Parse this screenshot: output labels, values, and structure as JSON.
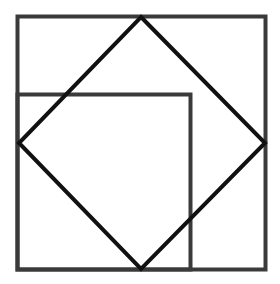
{
  "diagram": {
    "type": "geometric-figure",
    "colors": {
      "outer_square_stroke": "#3a3a3a",
      "inner_square_stroke": "#3a3a3a",
      "diamond_stroke": "#111111",
      "background": "#ffffff"
    },
    "shapes": {
      "outer_square": {
        "x": 17.5,
        "y": 16.5,
        "width": 248,
        "height": 253
      },
      "inner_square": {
        "x": 17.5,
        "y": 94.5,
        "width": 173,
        "height": 175
      },
      "diamond": {
        "points": "141,17 265,143 141,269 19,143"
      }
    }
  }
}
